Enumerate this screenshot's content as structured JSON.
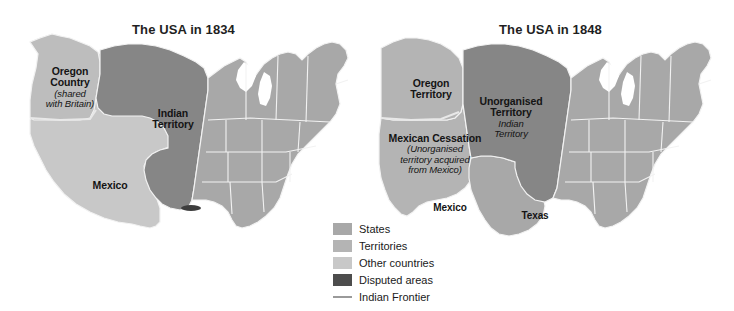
{
  "figure": {
    "background_color": "#ffffff"
  },
  "palette": {
    "states": "#a8a8a8",
    "territories": "#b4b4b4",
    "other_countries": "#c6c6c6",
    "disputed_areas": "#4d4d4d",
    "indian_territory": "#868686",
    "indian_frontier_line": "#9a9a9a",
    "border_line": "#f2f2f2",
    "text": "#141414"
  },
  "maps": [
    {
      "id": "usa-1834",
      "title": "The USA in 1834",
      "labels": [
        {
          "name": "oregon-country",
          "main": "Oregon\nCountry",
          "sub": "(shared\nwith Britain)",
          "x": 30,
          "y": 66,
          "width": 80
        },
        {
          "name": "indian-territory",
          "main": "Indian\nTerritory",
          "sub": "",
          "x": 133,
          "y": 108,
          "width": 80
        },
        {
          "name": "mexico",
          "main": "Mexico",
          "sub": "",
          "x": 70,
          "y": 180,
          "width": 80
        }
      ]
    },
    {
      "id": "usa-1848",
      "title": "The USA in 1848",
      "labels": [
        {
          "name": "oregon-territory",
          "main": "Oregon\nTerritory",
          "sub": "",
          "x": 20,
          "y": 78,
          "width": 88
        },
        {
          "name": "unorganised-territory",
          "main": "Unorganised\nTerritory",
          "sub": "Indian\nTerritory",
          "x": 98,
          "y": 96,
          "width": 92
        },
        {
          "name": "mexican-cessation",
          "main": "Mexican Cessation",
          "sub": "(Unorganised\nterritory acquired\nfrom Mexico)",
          "x": 4,
          "y": 133,
          "width": 128
        },
        {
          "name": "mexico",
          "main": "Mexico",
          "sub": "",
          "x": 50,
          "y": 203,
          "width": 66
        },
        {
          "name": "texas",
          "main": "Texas",
          "sub": "",
          "x": 135,
          "y": 211,
          "width": 66
        }
      ]
    }
  ],
  "legend": {
    "items": [
      {
        "label": "States",
        "type": "swatch",
        "color": "#a8a8a8"
      },
      {
        "label": "Territories",
        "type": "swatch",
        "color": "#b4b4b4"
      },
      {
        "label": "Other countries",
        "type": "swatch",
        "color": "#c8c8c8"
      },
      {
        "label": "Disputed areas",
        "type": "swatch",
        "color": "#4d4d4d"
      },
      {
        "label": "Indian Frontier",
        "type": "line",
        "color": "#9a9a9a"
      }
    ]
  }
}
